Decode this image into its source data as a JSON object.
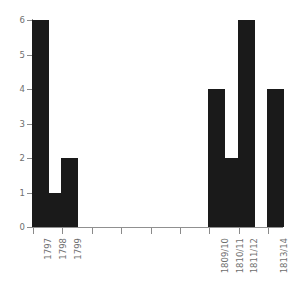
{
  "chart_data": {
    "type": "bar",
    "title": "",
    "subtitle": "",
    "xlabel": "",
    "ylabel": "",
    "ylim": [
      0,
      6
    ],
    "y_ticks": [
      0,
      1,
      2,
      3,
      4,
      5,
      6
    ],
    "y_tick_labels": [
      "0",
      "1",
      "2",
      "3",
      "4",
      "5",
      "6"
    ],
    "grid": false,
    "legend": null,
    "bar_color": "#1a1a1a",
    "axis_color": "#8a8a8a",
    "tick_label_color": "#6e6e6e",
    "x_label_rotation": 90,
    "categories": [
      "1797",
      "1798",
      "1799",
      "1800",
      "1801",
      "1802",
      "1803",
      "1804",
      "1805",
      "1806",
      "1807",
      "1808",
      "1809/10",
      "1810/11",
      "1811/12",
      "1812/13",
      "1813/14"
    ],
    "values": [
      6,
      1,
      2,
      0,
      0,
      0,
      0,
      0,
      0,
      0,
      0,
      0,
      4,
      2,
      6,
      0,
      4
    ],
    "visible_x_tick_labels": [
      "1797",
      "1798",
      "1799",
      "1809/10",
      "1810/11",
      "1811/12",
      "1813/14"
    ],
    "bars": [
      {
        "category": "1797",
        "value": 6,
        "labeled": true
      },
      {
        "category": "1798",
        "value": 1,
        "labeled": true
      },
      {
        "category": "1799",
        "value": 2,
        "labeled": true
      },
      {
        "category": "1800",
        "value": 0,
        "labeled": false
      },
      {
        "category": "1801",
        "value": 0,
        "labeled": false
      },
      {
        "category": "1802",
        "value": 0,
        "labeled": false
      },
      {
        "category": "1803",
        "value": 0,
        "labeled": false
      },
      {
        "category": "1804",
        "value": 0,
        "labeled": false
      },
      {
        "category": "1805",
        "value": 0,
        "labeled": false
      },
      {
        "category": "1806",
        "value": 0,
        "labeled": false
      },
      {
        "category": "1807",
        "value": 0,
        "labeled": false
      },
      {
        "category": "1808",
        "value": 0,
        "labeled": false
      },
      {
        "category": "1809/10",
        "value": 4,
        "labeled": true
      },
      {
        "category": "1810/11",
        "value": 2,
        "labeled": true
      },
      {
        "category": "1811/12",
        "value": 6,
        "labeled": true
      },
      {
        "category": "1812/13",
        "value": 0,
        "labeled": false
      },
      {
        "category": "1813/14",
        "value": 4,
        "labeled": true
      }
    ]
  }
}
